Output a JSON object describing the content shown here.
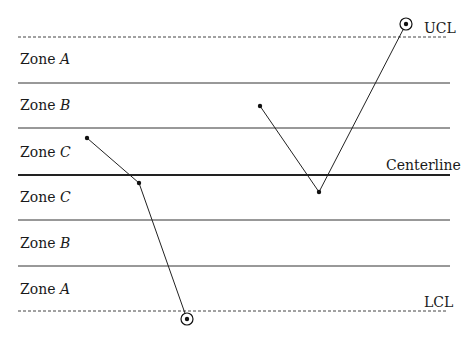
{
  "diagram": {
    "limits": {
      "ucl_label": "UCL",
      "centerline_label": "Centerline",
      "lcl_label": "LCL"
    },
    "zones": [
      {
        "prefix": "Zone",
        "letter": "A",
        "y": 55
      },
      {
        "prefix": "Zone",
        "letter": "B",
        "y": 101
      },
      {
        "prefix": "Zone",
        "letter": "C",
        "y": 147
      },
      {
        "prefix": "Zone",
        "letter": "C",
        "y": 190
      },
      {
        "prefix": "Zone",
        "letter": "B",
        "y": 237
      },
      {
        "prefix": "Zone",
        "letter": "A",
        "y": 282
      }
    ],
    "lines": {
      "ucl_y": 37,
      "a_b_upper_y": 83,
      "b_c_upper_y": 128,
      "center_y": 175,
      "c_b_lower_y": 220,
      "b_a_lower_y": 266,
      "lcl_y": 311
    },
    "series": [
      {
        "name": "run-1",
        "points": [
          [
            87,
            138
          ],
          [
            139,
            183
          ],
          [
            187,
            319
          ]
        ],
        "circled": [
          2
        ]
      },
      {
        "name": "run-2",
        "points": [
          [
            260,
            106
          ],
          [
            319,
            192
          ],
          [
            406,
            24
          ]
        ],
        "circled": [
          2
        ]
      }
    ]
  }
}
